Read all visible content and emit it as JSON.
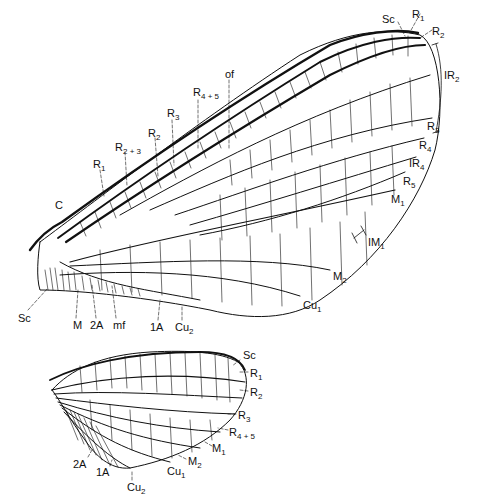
{
  "figure": {
    "forewing": {
      "labels": [
        {
          "id": "Sc",
          "base": "Sc",
          "sub": "",
          "x": 382,
          "y": 14
        },
        {
          "id": "R1_tip",
          "base": "R",
          "sub": "1",
          "x": 412,
          "y": 9
        },
        {
          "id": "R2_tip",
          "base": "R",
          "sub": "2",
          "x": 432,
          "y": 26
        },
        {
          "id": "IR2",
          "base": "IR",
          "sub": "2",
          "x": 444,
          "y": 70
        },
        {
          "id": "R3_tip",
          "base": "R",
          "sub": "3",
          "x": 427,
          "y": 121
        },
        {
          "id": "R4",
          "base": "R",
          "sub": "4",
          "x": 419,
          "y": 140
        },
        {
          "id": "IR4",
          "base": "IR",
          "sub": "4",
          "x": 409,
          "y": 158
        },
        {
          "id": "R5",
          "base": "R",
          "sub": "5",
          "x": 403,
          "y": 176
        },
        {
          "id": "M1",
          "base": "M",
          "sub": "1",
          "x": 391,
          "y": 194
        },
        {
          "id": "IM1",
          "base": "IM",
          "sub": "1",
          "x": 368,
          "y": 237
        },
        {
          "id": "M2",
          "base": "M",
          "sub": "2",
          "x": 333,
          "y": 271
        },
        {
          "id": "Cu1",
          "base": "Cu",
          "sub": "1",
          "x": 303,
          "y": 300
        },
        {
          "id": "C",
          "base": "C",
          "sub": "",
          "x": 55,
          "y": 200
        },
        {
          "id": "R1_base",
          "base": "R",
          "sub": "1",
          "x": 93,
          "y": 159
        },
        {
          "id": "R2plus3",
          "base": "R",
          "sub": "2 + 3",
          "x": 115,
          "y": 142
        },
        {
          "id": "R2_base",
          "base": "R",
          "sub": "2",
          "x": 148,
          "y": 128
        },
        {
          "id": "R3_base",
          "base": "R",
          "sub": "3",
          "x": 167,
          "y": 108
        },
        {
          "id": "R4plus5",
          "base": "R",
          "sub": "4 + 5",
          "x": 193,
          "y": 87
        },
        {
          "id": "of",
          "base": "of",
          "sub": "",
          "x": 225,
          "y": 69
        },
        {
          "id": "Sc_base",
          "base": "Sc",
          "sub": "",
          "x": 18,
          "y": 313
        },
        {
          "id": "M",
          "base": "M",
          "sub": "",
          "x": 73,
          "y": 320
        },
        {
          "id": "2A",
          "base": "2A",
          "sub": "",
          "x": 90,
          "y": 320
        },
        {
          "id": "mf",
          "base": "mf",
          "sub": "",
          "x": 113,
          "y": 320
        },
        {
          "id": "1A",
          "base": "1A",
          "sub": "",
          "x": 150,
          "y": 322
        },
        {
          "id": "Cu2",
          "base": "Cu",
          "sub": "2",
          "x": 175,
          "y": 322
        }
      ]
    },
    "hindwing": {
      "labels": [
        {
          "id": "Sc",
          "base": "Sc",
          "sub": "",
          "x": 243,
          "y": 350
        },
        {
          "id": "R1",
          "base": "R",
          "sub": "1",
          "x": 250,
          "y": 368
        },
        {
          "id": "R2",
          "base": "R",
          "sub": "2",
          "x": 250,
          "y": 387
        },
        {
          "id": "R3",
          "base": "R",
          "sub": "3",
          "x": 238,
          "y": 410
        },
        {
          "id": "R4plus5",
          "base": "R",
          "sub": "4 + 5",
          "x": 229,
          "y": 427
        },
        {
          "id": "M1",
          "base": "M",
          "sub": "1",
          "x": 212,
          "y": 443
        },
        {
          "id": "M2",
          "base": "M",
          "sub": "2",
          "x": 188,
          "y": 456
        },
        {
          "id": "Cu1",
          "base": "Cu",
          "sub": "1",
          "x": 167,
          "y": 466
        },
        {
          "id": "2A",
          "base": "2A",
          "sub": "",
          "x": 73,
          "y": 459
        },
        {
          "id": "1A",
          "base": "1A",
          "sub": "",
          "x": 96,
          "y": 467
        },
        {
          "id": "Cu2",
          "base": "Cu",
          "sub": "2",
          "x": 127,
          "y": 482
        }
      ]
    }
  }
}
